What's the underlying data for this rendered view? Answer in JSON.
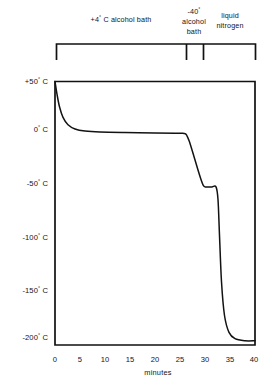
{
  "chart_data": {
    "type": "line",
    "title": "",
    "xlabel": "minutes",
    "ylabel": "",
    "xlim": [
      0,
      40
    ],
    "ylim": [
      -200,
      50
    ],
    "grid": false,
    "legend_position": "none",
    "x_ticks": [
      0,
      5,
      10,
      15,
      20,
      25,
      30,
      35,
      40
    ],
    "x_tick_labels": [
      "0",
      "5",
      "10",
      "15",
      "20",
      "25",
      "30",
      "35",
      "40"
    ],
    "y_ticks": [
      50,
      0,
      -50,
      -100,
      -150,
      -200
    ],
    "y_tick_labels": [
      "+50",
      "0",
      "-50",
      "-100",
      "-150",
      "-200"
    ],
    "y_unit_degree": "°",
    "y_unit_scale": "C",
    "series": [
      {
        "name": "specimen temperature",
        "units": "degrees C",
        "x": [
          0,
          0.4,
          0.9,
          1.6,
          2.6,
          4.0,
          6.0,
          9.0,
          14.0,
          20.0,
          24.0,
          25.6,
          26.2,
          26.8,
          27.6,
          28.6,
          29.2,
          29.6,
          30.0,
          30.6,
          31.4,
          32.2,
          32.6,
          32.9,
          33.3,
          33.9,
          34.8,
          36.0,
          38.0,
          40.0
        ],
        "y": [
          50,
          38,
          26,
          16,
          9,
          5,
          3,
          2,
          1.5,
          1.2,
          1.0,
          0.8,
          0,
          -6,
          -18,
          -34,
          -43,
          -48,
          -50,
          -50,
          -50,
          -50,
          -62,
          -96,
          -140,
          -172,
          -188,
          -194,
          -196,
          -196
        ]
      }
    ],
    "annotations": [
      {
        "label": "+4° C alcohol bath",
        "lines": [
          "+4° C alcohol bath"
        ],
        "x_start": 0,
        "x_end": 26.2
      },
      {
        "label": "-40° alcohol bath",
        "lines": [
          "-40°",
          "alcohol",
          "bath"
        ],
        "x_start": 26.2,
        "x_end": 29.6
      },
      {
        "label": "liquid nitrogen",
        "lines": [
          "liquid",
          "nitrogen"
        ],
        "x_start": 29.6,
        "x_end": 40
      }
    ]
  },
  "brackets": {
    "segments": [
      {
        "id": "alcohol-bath-warm",
        "line1": "+4",
        "degree": "°",
        "line1_rest": " C alcohol bath",
        "line2": "",
        "line3": ""
      },
      {
        "id": "alcohol-bath-cold",
        "line1": "-40",
        "degree": "°",
        "line1_rest": "",
        "line2": "alcohol",
        "line3": "bath"
      },
      {
        "id": "liquid-nitrogen",
        "line1": "liquid",
        "degree": "",
        "line1_rest": "",
        "line2": "nitrogen",
        "line3": ""
      }
    ]
  },
  "axes": {
    "y_labels": [
      {
        "value": "+50",
        "degree": "°",
        "unit": "C"
      },
      {
        "value": "0",
        "degree": "°",
        "unit": "C"
      },
      {
        "value": "-50",
        "degree": "°",
        "unit": "C"
      },
      {
        "value": "-100",
        "degree": "°",
        "unit": "C"
      },
      {
        "value": "-150",
        "degree": "°",
        "unit": "C"
      },
      {
        "value": "-200",
        "degree": "°",
        "unit": "C"
      }
    ],
    "x_labels": [
      "0",
      "5",
      "10",
      "15",
      "20",
      "25",
      "30",
      "35",
      "40"
    ],
    "x_title": "minutes"
  },
  "colors": {
    "ink": "#111111",
    "background": "#ffffff",
    "curve": "#121212"
  }
}
